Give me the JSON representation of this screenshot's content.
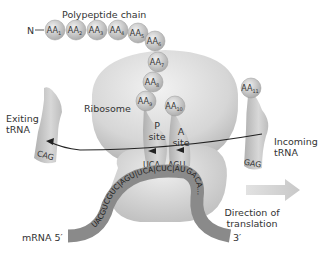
{
  "labels": {
    "polypeptide_chain": "Polypeptide chain",
    "n_terminus": "N",
    "ribosome": "Ribosome",
    "p_site_line1": "P",
    "p_site_line2": "site",
    "a_site_line1": "A",
    "a_site_line2": "site",
    "exiting_trna_line1": "Exiting",
    "exiting_trna_line2": "tRNA",
    "incoming_trna_line1": "Incoming",
    "incoming_trna_line2": "tRNA",
    "direction_line1": "Direction of",
    "direction_line2": "translation",
    "mrna": "mRNA 5′",
    "three_prime": "3′"
  },
  "amino_acids": [
    {
      "base": "AA",
      "sub": "1"
    },
    {
      "base": "AA",
      "sub": "2"
    },
    {
      "base": "AA",
      "sub": "3"
    },
    {
      "base": "AA",
      "sub": "4"
    },
    {
      "base": "AA",
      "sub": "5"
    },
    {
      "base": "AA",
      "sub": "6"
    },
    {
      "base": "AA",
      "sub": "7"
    },
    {
      "base": "AA",
      "sub": "8"
    },
    {
      "base": "AA",
      "sub": "9"
    },
    {
      "base": "AA",
      "sub": "10"
    },
    {
      "base": "AA",
      "sub": "11"
    }
  ],
  "anticodons": {
    "exiting": "CAG",
    "p_site": "UCA",
    "a_site": "AGU",
    "incoming": "GAG"
  },
  "mrna_sequence": "UACGUCGUC|AGU|UCA|CUC|AUGACA...",
  "colors": {
    "ribosome": "#d9d9d9",
    "trna": "#c4c4c4",
    "mrna": "#8a8a8a",
    "amino_acid": "#bdbdbd",
    "arrow": "#cfcfcf",
    "text": "#333333"
  }
}
